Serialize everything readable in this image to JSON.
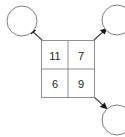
{
  "diagram": {
    "type": "matrix-with-outgoing-arrows",
    "grid": {
      "rows": 2,
      "cols": 2,
      "cells": [
        [
          {
            "value": "11"
          },
          {
            "value": "7"
          }
        ],
        [
          {
            "value": "6"
          },
          {
            "value": "9"
          }
        ]
      ],
      "border_color": "#909090",
      "text_color": "#262626",
      "background": "#ffffff"
    },
    "nodes": [
      {
        "id": "node-top-left",
        "label": "",
        "cx": 22,
        "cy": 21,
        "r": 15,
        "clipped": false
      },
      {
        "id": "node-top-right",
        "label": "",
        "cx": 117,
        "cy": 20,
        "r": 15,
        "clipped": true
      },
      {
        "id": "node-bottom-right",
        "label": "",
        "cx": 117,
        "cy": 120,
        "r": 15,
        "clipped": true
      }
    ],
    "edges": [
      {
        "id": "edge-to-top-left",
        "from": "grid-corner-top-left",
        "to": "node-top-left",
        "direction": "up-left",
        "arrowhead": true
      },
      {
        "id": "edge-to-top-right",
        "from": "grid-corner-top-right",
        "to": "node-top-right",
        "direction": "up-right",
        "arrowhead": true
      },
      {
        "id": "edge-to-bottom-right",
        "from": "grid-corner-bottom-right",
        "to": "node-bottom-right",
        "direction": "down-right",
        "arrowhead": true
      }
    ],
    "colors": {
      "circle_stroke": "#808080",
      "edge_stroke": "#404040",
      "arrow_fill": "#1a1a1a",
      "canvas_background": "#ffffff"
    }
  }
}
